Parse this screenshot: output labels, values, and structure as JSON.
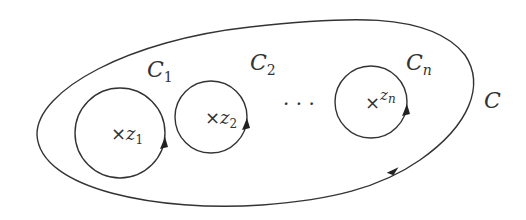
{
  "diagram": {
    "type": "contour-deformation",
    "outer_contour": {
      "label": "C",
      "arrow_direction": "counterclockwise"
    },
    "inner_contours": [
      {
        "label": "C",
        "label_subscript": "1",
        "point": "z",
        "point_subscript": "1",
        "marker": "×"
      },
      {
        "label": "C",
        "label_subscript": "2",
        "point": "z",
        "point_subscript": "2",
        "marker": "×"
      },
      {
        "label": "C",
        "label_subscript": "n",
        "point": "z",
        "point_subscript": "n",
        "marker": "×"
      }
    ],
    "ellipsis": "· · ·",
    "colors": {
      "stroke": "#333333",
      "background": "#ffffff"
    }
  }
}
